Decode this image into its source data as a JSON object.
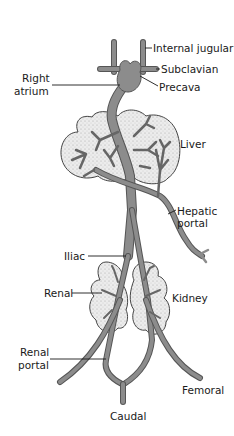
{
  "diagram": {
    "type": "anatomical venous system",
    "colors": {
      "vessel": "#8c8c8c",
      "vessel_outline": "#555555",
      "organ_fill": "#e4e4e4",
      "organ_outline": "#444444",
      "label": "#1a1a1a",
      "leader": "#1a1a1a",
      "background": "#ffffff"
    },
    "labels": {
      "internal_jugular": "Internal jugular",
      "subclavian": "Subclavian",
      "precava": "Precava",
      "right_atrium_1": "Right",
      "right_atrium_2": "atrium",
      "liver": "Liver",
      "hepatic_portal_1": "Hepatic",
      "hepatic_portal_2": "portal",
      "iliac": "Iliac",
      "renal": "Renal",
      "kidney": "Kidney",
      "renal_portal_1": "Renal",
      "renal_portal_2": "portal",
      "femoral": "Femoral",
      "caudal": "Caudal"
    }
  }
}
